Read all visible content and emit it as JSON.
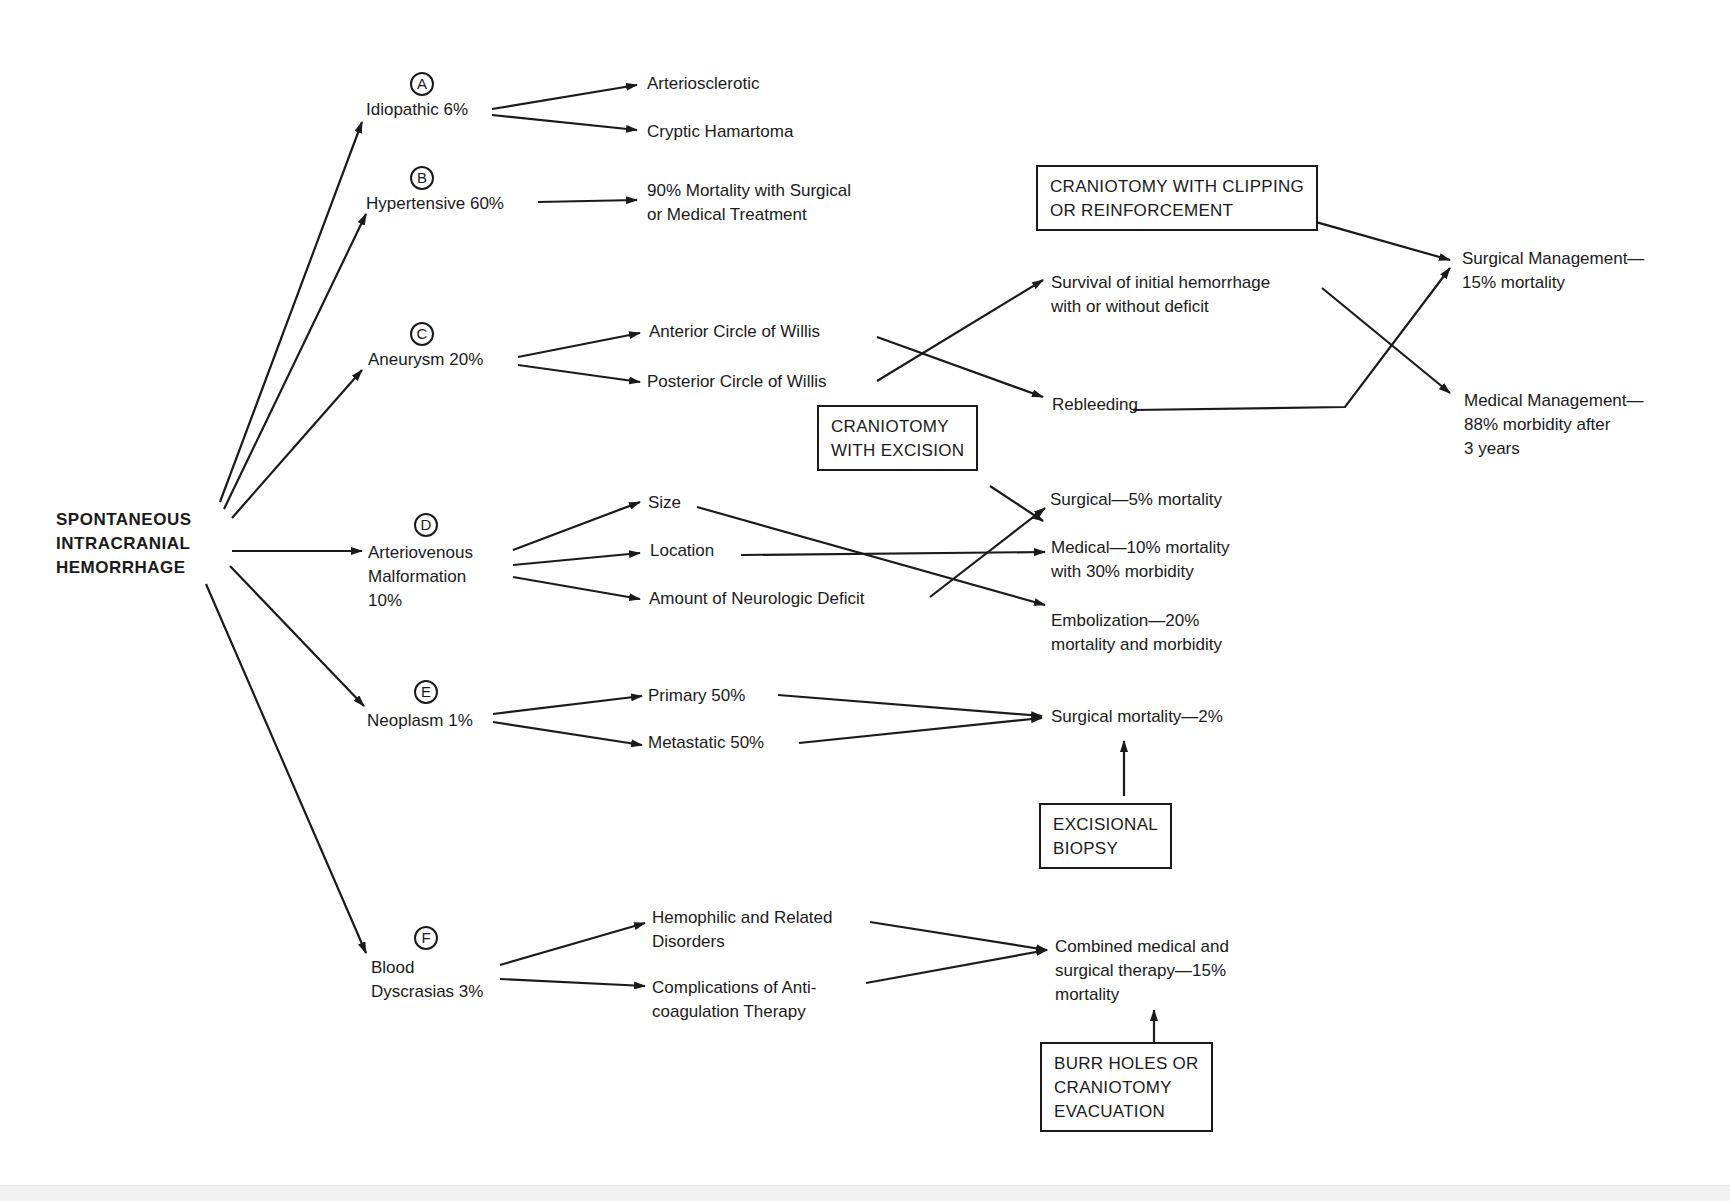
{
  "diagram": {
    "root": {
      "lines": [
        "SPONTANEOUS",
        "INTRACRANIAL",
        "HEMORRHAGE"
      ]
    },
    "categories": [
      {
        "badge": "A",
        "lines": [
          "Idiopathic 6%"
        ]
      },
      {
        "badge": "B",
        "lines": [
          "Hypertensive 60%"
        ]
      },
      {
        "badge": "C",
        "lines": [
          "Aneurysm 20%"
        ]
      },
      {
        "badge": "D",
        "lines": [
          "Arteriovenous",
          "Malformation",
          "10%"
        ]
      },
      {
        "badge": "E",
        "lines": [
          "Neoplasm 1%"
        ]
      },
      {
        "badge": "F",
        "lines": [
          "Blood",
          "Dyscrasias 3%"
        ]
      }
    ],
    "idiopathic": {
      "arteriosclerotic": "Arteriosclerotic",
      "cryptic": "Cryptic Hamartoma"
    },
    "hypertensive": {
      "outcome": [
        "90% Mortality with Surgical",
        "or Medical Treatment"
      ]
    },
    "aneurysm": {
      "anterior": "Anterior Circle of Willis",
      "posterior": "Posterior Circle of Willis",
      "survival": [
        "Survival of initial hemorrhage",
        "with or without deficit"
      ],
      "rebleeding": "Rebleeding",
      "surgical_mgmt": [
        "Surgical Management—",
        "15% mortality"
      ],
      "medical_mgmt": [
        "Medical Management—",
        "88% morbidity after",
        "3 years"
      ],
      "procedure_box": [
        "CRANIOTOMY WITH CLIPPING",
        "OR REINFORCEMENT"
      ]
    },
    "avm": {
      "size": "Size",
      "location": "Location",
      "deficit": "Amount of Neurologic Deficit",
      "surgical": [
        "Surgical—5% mortality"
      ],
      "medical": [
        "Medical—10% mortality",
        "with 30% morbidity"
      ],
      "embolization": [
        "Embolization—20%",
        "mortality and morbidity"
      ],
      "procedure_box": [
        "CRANIOTOMY",
        "WITH EXCISION"
      ]
    },
    "neoplasm": {
      "primary": "Primary 50%",
      "metastatic": "Metastatic 50%",
      "outcome": [
        "Surgical mortality—2%"
      ],
      "procedure_box": [
        "EXCISIONAL",
        "BIOPSY"
      ]
    },
    "blood": {
      "hemophilic": [
        "Hemophilic and Related",
        "Disorders"
      ],
      "anticoag": [
        "Complications of Anti-",
        "coagulation Therapy"
      ],
      "outcome": [
        "Combined medical and",
        "surgical therapy—15%",
        "mortality"
      ],
      "procedure_box": [
        "BURR HOLES OR",
        "CRANIOTOMY",
        "EVACUATION"
      ]
    },
    "colors": {
      "ink": "#1a1a1a",
      "paper": "#ffffff"
    }
  }
}
